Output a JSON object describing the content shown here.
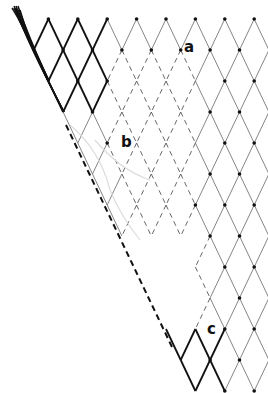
{
  "diagram": {
    "title": "",
    "grid": {
      "x0": 19,
      "y0": 19,
      "dx": 29.4,
      "dy": 31,
      "rows": 13,
      "cols": 9
    },
    "colors": {
      "bold": "#111111",
      "thin": "#777777",
      "dashed": "#555555",
      "node": "#111111",
      "ghost": "#dddddd"
    },
    "labels": [
      {
        "id": "a",
        "text": "a",
        "x": 184,
        "y": 44
      },
      {
        "id": "b",
        "text": "b",
        "x": 121,
        "y": 139
      },
      {
        "id": "c",
        "text": "c",
        "x": 207,
        "y": 326
      }
    ],
    "cut_line": {
      "x1": 66,
      "y1": 125,
      "x2": 172,
      "y2": 347,
      "style": "dashed-bold"
    }
  }
}
